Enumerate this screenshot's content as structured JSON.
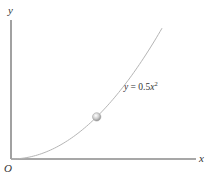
{
  "chart_data": {
    "type": "line",
    "title": "",
    "xlabel": "x",
    "ylabel": "y",
    "origin_label": "O",
    "equation_label": {
      "lhs": "y",
      "eq": " = 0.5",
      "var": "x",
      "exp": "2"
    },
    "function": {
      "coefficient": 0.5,
      "power": 2
    },
    "xlim": [
      0,
      4.9
    ],
    "ylim": [
      0,
      8.5
    ],
    "curve_x_range": [
      0,
      4
    ],
    "grid": false,
    "ticks": false,
    "series": [
      {
        "name": "y = 0.5x^2",
        "color": "#b5b5b5"
      }
    ],
    "marker": {
      "name": "particle",
      "x": 2.27,
      "color": "#c8c8c8"
    },
    "axis_color": "#8a8a8a"
  }
}
